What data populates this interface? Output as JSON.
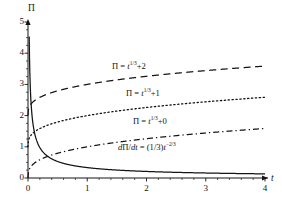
{
  "chart_data": {
    "type": "line",
    "title": "",
    "xlabel": "t",
    "ylabel": "Π",
    "xlim": [
      0,
      4
    ],
    "ylim": [
      0,
      5
    ],
    "xticks": [
      "0",
      "1",
      "2",
      "3",
      "4"
    ],
    "yticks": [
      "0",
      "1",
      "2",
      "3",
      "4",
      "5"
    ],
    "grid": false,
    "legend_position": "inline-annotations",
    "series": [
      {
        "name": "Π = t^(1/3) + 2",
        "style": "dashed",
        "formula": "t^(1/3)+2",
        "x": [
          0,
          0.25,
          0.5,
          0.75,
          1,
          1.5,
          2,
          2.5,
          3,
          3.5,
          4
        ],
        "values": [
          2.0,
          2.63,
          2.79,
          2.91,
          3.0,
          3.14,
          3.26,
          3.36,
          3.44,
          3.52,
          3.59
        ]
      },
      {
        "name": "Π = t^(1/3) + 1",
        "style": "dotted",
        "formula": "t^(1/3)+1",
        "x": [
          0,
          0.25,
          0.5,
          0.75,
          1,
          1.5,
          2,
          2.5,
          3,
          3.5,
          4
        ],
        "values": [
          1.0,
          1.63,
          1.79,
          1.91,
          2.0,
          2.14,
          2.26,
          2.36,
          2.44,
          2.52,
          2.59
        ]
      },
      {
        "name": "Π = t^(1/3) + 0",
        "style": "dash-dot",
        "formula": "t^(1/3)+0",
        "x": [
          0,
          0.25,
          0.5,
          0.75,
          1,
          1.5,
          2,
          2.5,
          3,
          3.5,
          4
        ],
        "values": [
          0.0,
          0.63,
          0.79,
          0.91,
          1.0,
          1.14,
          1.26,
          1.36,
          1.44,
          1.52,
          1.59
        ]
      },
      {
        "name": "dΠ/dt = (1/3)t^(-2/3)",
        "style": "solid",
        "formula": "(1/3)t^(-2/3)",
        "x": [
          0.02,
          0.05,
          0.1,
          0.2,
          0.3,
          0.5,
          0.75,
          1,
          1.5,
          2,
          2.5,
          3,
          3.5,
          4
        ],
        "values": [
          4.52,
          2.46,
          1.55,
          0.98,
          0.75,
          0.53,
          0.4,
          0.33,
          0.25,
          0.21,
          0.18,
          0.16,
          0.15,
          0.13
        ]
      }
    ],
    "annotations": [
      {
        "id": "label-pi-plus-2",
        "text": "Π = t1/3+2",
        "html": "Π = <i>t</i><sup>1/3</sup>+2",
        "x_px": 112,
        "y_px": 61
      },
      {
        "id": "label-pi-plus-1",
        "text": "Π = t1/3+1",
        "html": "Π = <i>t</i><sup>1/3</sup>+1",
        "x_px": 126,
        "y_px": 88
      },
      {
        "id": "label-pi-plus-0",
        "text": "Π = t1/3+0",
        "html": "Π = <i>t</i><sup>1/3</sup>+0",
        "x_px": 133,
        "y_px": 116
      },
      {
        "id": "label-derivative",
        "text": "dΠ/dt = (1/3)t−2/3",
        "html": "<i>d</i>Π/<i>dt</i> = (1/3)<i>t</i><sup>−2/3</sup>",
        "x_px": 118,
        "y_px": 142
      }
    ],
    "colors": {
      "axis": "#141414",
      "curve": "#141414",
      "background": "#ffffff"
    }
  }
}
